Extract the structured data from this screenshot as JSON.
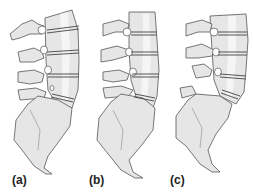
{
  "figure": {
    "colors": {
      "bone_fill": "#e6e6e6",
      "bone_highlight": "#f4f4f4",
      "outline": "#555555",
      "disc_line": "#444444",
      "background": "#ffffff"
    },
    "panels": [
      {
        "id": "a",
        "label": "(a)"
      },
      {
        "id": "b",
        "label": "(b)"
      },
      {
        "id": "c",
        "label": "(c)"
      }
    ]
  }
}
